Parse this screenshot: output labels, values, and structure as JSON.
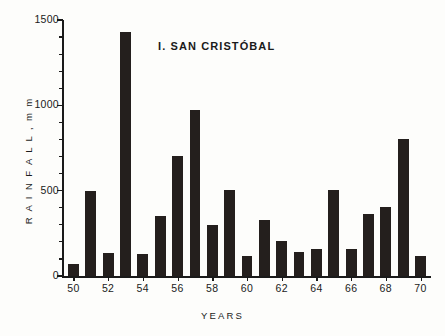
{
  "chart_data": {
    "type": "bar",
    "title": "I. SAN CRISTÓBAL",
    "xlabel": "YEARS",
    "ylabel": "R A I N F A L L ,  m m",
    "categories": [
      "50",
      "51",
      "52",
      "53",
      "54",
      "55",
      "56",
      "57",
      "58",
      "59",
      "60",
      "61",
      "62",
      "63",
      "64",
      "65",
      "66",
      "67",
      "68",
      "69",
      "70"
    ],
    "values": [
      70,
      500,
      135,
      1430,
      130,
      350,
      705,
      975,
      300,
      505,
      115,
      330,
      205,
      140,
      160,
      505,
      160,
      365,
      405,
      800,
      115
    ],
    "ylim": [
      0,
      1500
    ],
    "xlim": [
      49.4,
      70.6
    ],
    "ytick_labels": [
      "0",
      "500",
      "1000",
      "1500"
    ],
    "ytick_values": [
      0,
      500,
      1000,
      1500
    ],
    "yminor_step": 100,
    "xtick_labels": [
      "50",
      "52",
      "54",
      "56",
      "58",
      "60",
      "62",
      "64",
      "66",
      "68",
      "70"
    ],
    "xtick_values": [
      50,
      52,
      54,
      56,
      58,
      60,
      62,
      64,
      66,
      68,
      70
    ],
    "grid": false,
    "legend": false,
    "bar_color": "#241f1d",
    "axis_color": "#1a1a1a",
    "background_color": "#fdfdfb"
  }
}
